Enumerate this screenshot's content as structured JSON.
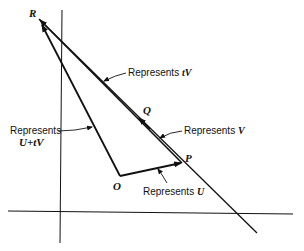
{
  "diagram": {
    "points": {
      "R": "R",
      "Q": "Q",
      "P": "P",
      "O": "O"
    },
    "labels": {
      "tV": {
        "prefix": "Represents",
        "symbol": "tV"
      },
      "V": {
        "prefix": "Represents",
        "symbol": "V"
      },
      "U": {
        "prefix": "Represents",
        "symbol": "U"
      },
      "UtV": {
        "prefix": "Represents",
        "symbol": "U+tV"
      }
    },
    "colors": {
      "ink": "#111111",
      "background": "#ffffff"
    }
  }
}
